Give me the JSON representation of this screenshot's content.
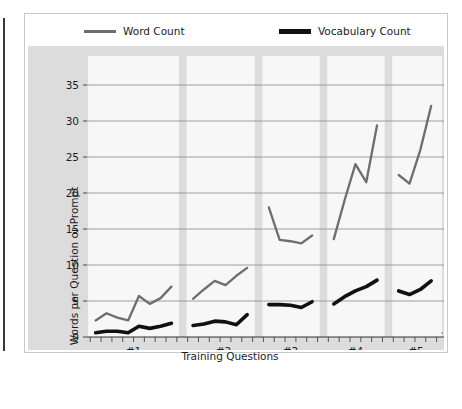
{
  "figure": {
    "ylabel": "Words per Question or Prompt",
    "xlabel": "Training Questions"
  },
  "legend": {
    "items": [
      {
        "label": "Word Count",
        "color": "#6e6e6e",
        "icon": "line-swatch-icon"
      },
      {
        "label": "Vocabulary Count",
        "color": "#111111",
        "icon": "line-swatch-icon"
      }
    ]
  },
  "colors": {
    "word_count": "#6e6e6e",
    "vocabulary_count": "#111111",
    "panel_background": "#dcdcdc",
    "band_background": "#f7f7f7",
    "gridline": "#888888",
    "axis": "#333333",
    "frame": "#c9c9c9"
  },
  "chart_data": {
    "type": "line",
    "title": "",
    "xlabel": "Training Questions",
    "ylabel": "Words per Question or Prompt",
    "ylim": [
      0,
      37
    ],
    "yticks": [
      0,
      5,
      10,
      15,
      20,
      25,
      30,
      35
    ],
    "xticks": [
      "#1",
      "#2",
      "#3",
      "#4",
      "#5"
    ],
    "grid": true,
    "legend_position": "top",
    "groups": [
      {
        "label": "#1",
        "x": [
          1,
          2,
          3,
          4,
          5,
          6,
          7,
          8
        ],
        "word_count": [
          2.3,
          3.3,
          2.7,
          2.3,
          5.7,
          4.6,
          5.4,
          7.0
        ],
        "vocabulary_count": [
          0.6,
          0.8,
          0.8,
          0.6,
          1.5,
          1.2,
          1.5,
          1.9
        ]
      },
      {
        "label": "#2",
        "x": [
          10,
          11,
          12,
          13,
          14,
          15
        ],
        "word_count": [
          5.3,
          6.6,
          7.8,
          7.2,
          8.5,
          9.6
        ],
        "vocabulary_count": [
          1.6,
          1.8,
          2.2,
          2.1,
          1.7,
          3.1
        ]
      },
      {
        "label": "#3",
        "x": [
          17,
          18,
          19,
          20,
          21
        ],
        "word_count": [
          18.0,
          13.5,
          13.3,
          13.0,
          14.1
        ],
        "vocabulary_count": [
          4.5,
          4.5,
          4.4,
          4.1,
          4.9
        ]
      },
      {
        "label": "#4",
        "x": [
          23,
          24,
          25,
          26,
          27
        ],
        "word_count": [
          13.6,
          19.0,
          24.0,
          21.5,
          29.4
        ],
        "vocabulary_count": [
          4.6,
          5.6,
          6.4,
          7.0,
          7.9
        ]
      },
      {
        "label": "#5",
        "x": [
          29,
          30,
          31,
          32
        ],
        "word_count": [
          22.5,
          21.3,
          26.0,
          32.1
        ],
        "vocabulary_count": [
          6.4,
          5.9,
          6.6,
          7.8
        ]
      }
    ],
    "series": [
      {
        "name": "Word Count",
        "color": "#6e6e6e"
      },
      {
        "name": "Vocabulary Count",
        "color": "#111111"
      }
    ]
  }
}
